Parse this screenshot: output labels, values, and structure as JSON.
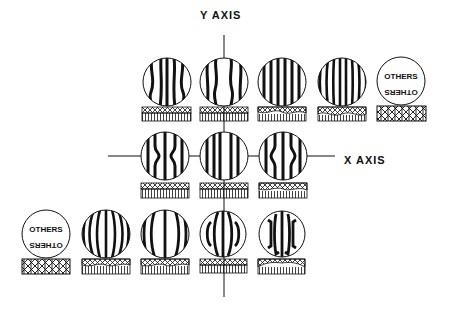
{
  "diagram": {
    "y_axis_label": "Y AXIS",
    "x_axis_label": "X AXIS",
    "others_label": "OTHERS",
    "colors": {
      "ink": "#111111",
      "background": "#ffffff"
    },
    "rows": [
      {
        "name": "top-row",
        "cells": [
          {
            "type": "fringe",
            "pattern": "wavy-wide"
          },
          {
            "type": "fringe",
            "pattern": "wavy-center"
          },
          {
            "type": "fringe",
            "pattern": "straight"
          },
          {
            "type": "fringe",
            "pattern": "straight-dense"
          },
          {
            "type": "others"
          }
        ]
      },
      {
        "name": "middle-row",
        "cells": [
          {
            "type": "fringe",
            "pattern": "pinched-in"
          },
          {
            "type": "fringe",
            "pattern": "straight"
          },
          {
            "type": "fringe",
            "pattern": "pinched-out"
          }
        ]
      },
      {
        "name": "bottom-row",
        "cells": [
          {
            "type": "others"
          },
          {
            "type": "fringe",
            "pattern": "curved-outward-dense"
          },
          {
            "type": "fringe",
            "pattern": "curved-outward"
          },
          {
            "type": "fringe",
            "pattern": "bracket"
          },
          {
            "type": "fringe",
            "pattern": "bracket-wide"
          }
        ]
      }
    ]
  }
}
